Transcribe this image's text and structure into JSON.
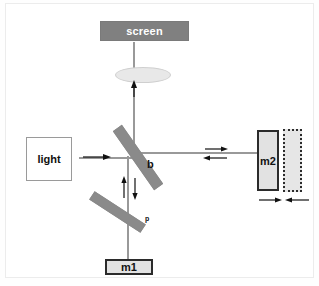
{
  "diagram": {
    "background_color": "#ffffff",
    "frame_color": "#ececec",
    "beam_color": "#999999",
    "plate_color": "#8a8a8a",
    "mirror_fill": "#e2e2e2",
    "mirror_border": "#2b2b2b"
  },
  "components": {
    "screen": {
      "label": "screen",
      "fill": "#808080",
      "text_color": "#ffffff"
    },
    "lens": {
      "label": "",
      "fill": "#e8e8e8"
    },
    "light_source": {
      "label": "light",
      "fill": "#ffffff",
      "text_color": "#111111"
    },
    "beam_splitter": {
      "label": "b",
      "fill": "#8a8a8a"
    },
    "compensator_plate": {
      "label": "p",
      "fill": "#8a8a8a"
    },
    "mirror_1": {
      "label": "m1",
      "fill": "#e2e2e2"
    },
    "mirror_2": {
      "label": "m2",
      "fill": "#e2e2e2"
    },
    "mirror_2_shifted": {
      "label": "",
      "fill": "#e6e6e6",
      "style": "dotted"
    }
  },
  "arrows": {
    "source_to_splitter": "right",
    "splitter_to_lens": "up",
    "splitter_to_m2_out": "right",
    "m2_to_splitter_in": "left",
    "splitter_to_m1_out": "down",
    "m1_to_splitter_in": "up",
    "m2_displacement_left": "right",
    "m2_displacement_right": "left"
  }
}
